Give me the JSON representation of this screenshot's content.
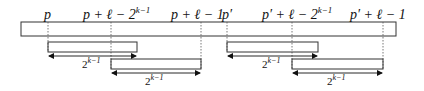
{
  "diagram": {
    "main_bar": {
      "x1": 21,
      "x2": 396,
      "y1": 22,
      "y2": 36
    },
    "marks": [
      {
        "id": "p",
        "x": 48,
        "label_base": "p",
        "label_rest": "",
        "sup": ""
      },
      {
        "id": "p-plus-l-minus-2k",
        "x": 111,
        "label_base": "p + ℓ − 2",
        "label_rest": "",
        "sup": "k−1"
      },
      {
        "id": "p-plus-l-minus-1",
        "x": 201,
        "label_base": "p + ℓ − 1",
        "label_rest": "",
        "sup": ""
      },
      {
        "id": "pprime",
        "x": 227,
        "label_base": "p′",
        "label_rest": "",
        "sup": ""
      },
      {
        "id": "pprime-plus-l-minus-2k",
        "x": 292,
        "label_base": "p′ + ℓ − 2",
        "label_rest": "",
        "sup": "k−1"
      },
      {
        "id": "pprime-plus-l-minus-1",
        "x": 383,
        "label_base": "p′ + ℓ − 1",
        "label_rest": "",
        "sup": ""
      }
    ],
    "intervals": [
      {
        "x1": 48,
        "x2": 137,
        "y1": 42,
        "y2": 52,
        "arrow_y": 56,
        "label_base": "2",
        "label_sup": "k−1",
        "label_y": 68
      },
      {
        "x1": 111,
        "x2": 201,
        "y1": 59,
        "y2": 69,
        "arrow_y": 73,
        "label_base": "2",
        "label_sup": "k−1",
        "label_y": 85
      },
      {
        "x1": 227,
        "x2": 318,
        "y1": 42,
        "y2": 52,
        "arrow_y": 56,
        "label_base": "2",
        "label_sup": "k−1",
        "label_y": 68
      },
      {
        "x1": 292,
        "x2": 383,
        "y1": 59,
        "y2": 69,
        "arrow_y": 73,
        "label_base": "2",
        "label_sup": "k−1",
        "label_y": 85
      }
    ],
    "labels": {
      "p": "p",
      "p_l_2k_base": "p + ℓ − 2",
      "p_l_1": "p + ℓ − 1",
      "pp": "p′",
      "pp_l_2k_base": "p′ + ℓ − 2",
      "pp_l_1": "p′ + ℓ − 1",
      "sup": "k−1",
      "two": "2"
    }
  }
}
